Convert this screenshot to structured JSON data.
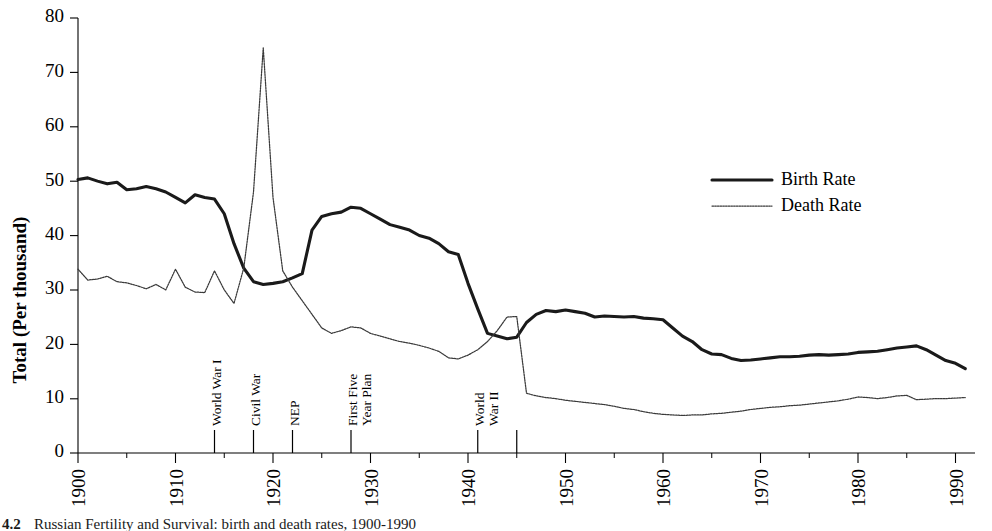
{
  "chart_data": {
    "type": "line",
    "title": "",
    "xlabel": "",
    "ylabel": "Total (Per thousand)",
    "xlim": [
      1900,
      1992
    ],
    "ylim": [
      0,
      80
    ],
    "grid": false,
    "legend_position": "top-right",
    "y_ticks": [
      0,
      10,
      20,
      30,
      40,
      50,
      60,
      70,
      80
    ],
    "x_ticks": [
      1900,
      1910,
      1920,
      1930,
      1940,
      1950,
      1960,
      1970,
      1980,
      1990
    ],
    "x_minor_tick_step": 5,
    "annotations": [
      {
        "label": "World War I",
        "year": 1914,
        "lines": [
          "World War I"
        ]
      },
      {
        "label": "Civil War",
        "year": 1918,
        "lines": [
          "Civil War"
        ]
      },
      {
        "label": "NEP",
        "year": 1922,
        "lines": [
          "NEP"
        ]
      },
      {
        "label": "First Five Year Plan",
        "year": 1928,
        "lines": [
          "First Five",
          "Year Plan"
        ]
      },
      {
        "label": "World War II",
        "year": 1941,
        "lines": [
          "World",
          "War II"
        ]
      },
      {
        "label": "",
        "year": 1945,
        "lines": []
      }
    ],
    "series": [
      {
        "name": "Birth Rate",
        "style": "solid-thick",
        "x": [
          1900,
          1901,
          1902,
          1903,
          1904,
          1905,
          1906,
          1907,
          1908,
          1909,
          1910,
          1911,
          1912,
          1913,
          1914,
          1915,
          1916,
          1917,
          1918,
          1919,
          1920,
          1921,
          1922,
          1923,
          1924,
          1925,
          1926,
          1927,
          1928,
          1929,
          1930,
          1931,
          1932,
          1933,
          1934,
          1935,
          1936,
          1937,
          1938,
          1939,
          1940,
          1941,
          1942,
          1943,
          1944,
          1945,
          1946,
          1947,
          1948,
          1949,
          1950,
          1951,
          1952,
          1953,
          1954,
          1955,
          1956,
          1957,
          1958,
          1959,
          1960,
          1961,
          1962,
          1963,
          1964,
          1965,
          1966,
          1967,
          1968,
          1969,
          1970,
          1971,
          1972,
          1973,
          1974,
          1975,
          1976,
          1977,
          1978,
          1979,
          1980,
          1981,
          1982,
          1983,
          1984,
          1985,
          1986,
          1987,
          1988,
          1989,
          1990,
          1991
        ],
        "values": [
          50.3,
          50.6,
          50.0,
          49.5,
          49.8,
          48.4,
          48.6,
          49.0,
          48.6,
          48.0,
          47.0,
          46.0,
          47.5,
          47.0,
          46.7,
          44.0,
          38.5,
          34.0,
          31.5,
          31.0,
          31.2,
          31.5,
          32.2,
          33.0,
          41.0,
          43.5,
          44.0,
          44.3,
          45.2,
          45.0,
          44.0,
          43.0,
          42.0,
          41.5,
          41.0,
          40.0,
          39.5,
          38.5,
          37.0,
          36.5,
          31.2,
          26.5,
          22.0,
          21.5,
          21.0,
          21.3,
          24.0,
          25.5,
          26.2,
          26.0,
          26.3,
          26.0,
          25.7,
          25.0,
          25.2,
          25.1,
          25.0,
          25.1,
          24.8,
          24.7,
          24.5,
          23.0,
          21.5,
          20.5,
          19.0,
          18.2,
          18.1,
          17.4,
          17.0,
          17.1,
          17.3,
          17.5,
          17.7,
          17.7,
          17.8,
          18.0,
          18.1,
          18.0,
          18.1,
          18.2,
          18.5,
          18.6,
          18.7,
          19.0,
          19.3,
          19.5,
          19.7,
          19.0,
          18.0,
          17.0,
          16.5,
          15.5
        ]
      },
      {
        "name": "Death Rate",
        "style": "dotted-thin",
        "x": [
          1900,
          1901,
          1902,
          1903,
          1904,
          1905,
          1906,
          1907,
          1908,
          1909,
          1910,
          1911,
          1912,
          1913,
          1914,
          1915,
          1916,
          1917,
          1918,
          1919,
          1920,
          1921,
          1922,
          1923,
          1924,
          1925,
          1926,
          1927,
          1928,
          1929,
          1930,
          1931,
          1932,
          1933,
          1934,
          1935,
          1936,
          1937,
          1938,
          1939,
          1940,
          1941,
          1942,
          1943,
          1944,
          1945,
          1946,
          1947,
          1948,
          1949,
          1950,
          1951,
          1952,
          1953,
          1954,
          1955,
          1956,
          1957,
          1958,
          1959,
          1960,
          1961,
          1962,
          1963,
          1964,
          1965,
          1966,
          1967,
          1968,
          1969,
          1970,
          1971,
          1972,
          1973,
          1974,
          1975,
          1976,
          1977,
          1978,
          1979,
          1980,
          1981,
          1982,
          1983,
          1984,
          1985,
          1986,
          1987,
          1988,
          1989,
          1990,
          1991
        ],
        "values": [
          33.8,
          31.8,
          32.0,
          32.5,
          31.5,
          31.3,
          30.8,
          30.2,
          31.0,
          30.0,
          33.8,
          30.5,
          29.6,
          29.5,
          33.5,
          30.0,
          27.5,
          34.0,
          48.0,
          74.5,
          47.0,
          33.5,
          30.5,
          28.0,
          25.5,
          23.0,
          22.0,
          22.5,
          23.2,
          23.0,
          22.0,
          21.5,
          21.0,
          20.5,
          20.2,
          19.8,
          19.3,
          18.7,
          17.5,
          17.3,
          18.0,
          19.0,
          20.5,
          22.5,
          25.0,
          25.1,
          11.0,
          10.5,
          10.2,
          10.0,
          9.7,
          9.5,
          9.3,
          9.1,
          8.9,
          8.6,
          8.2,
          8.0,
          7.6,
          7.3,
          7.1,
          7.0,
          6.9,
          7.0,
          7.0,
          7.2,
          7.3,
          7.5,
          7.7,
          8.0,
          8.2,
          8.4,
          8.5,
          8.7,
          8.8,
          9.0,
          9.2,
          9.4,
          9.6,
          9.9,
          10.3,
          10.2,
          10.0,
          10.2,
          10.5,
          10.6,
          9.8,
          9.9,
          10.0,
          10.0,
          10.1,
          10.2
        ]
      }
    ]
  },
  "legend": {
    "entries": [
      {
        "label": "Birth Rate",
        "style": "solid-thick"
      },
      {
        "label": "Death Rate",
        "style": "dotted-thin"
      }
    ]
  },
  "axes": {
    "y_title": "Total (Per thousand)"
  },
  "caption": {
    "number": "4.2",
    "text": "Russian Fertility and Survival: birth and death rates, 1900-1990"
  }
}
